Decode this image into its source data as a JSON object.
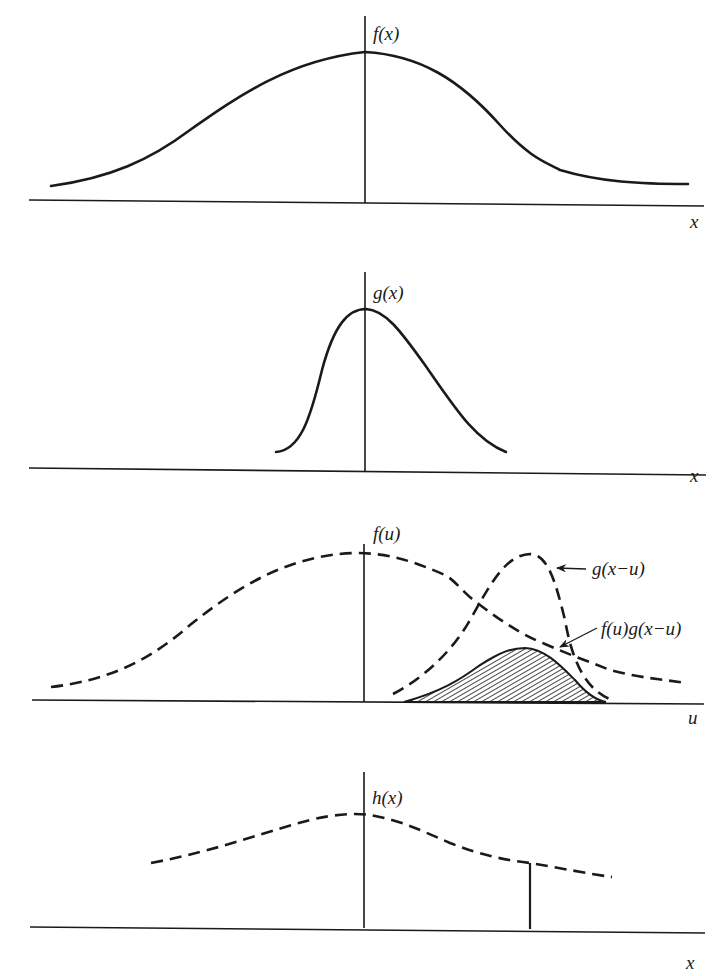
{
  "panels": [
    {
      "id": "f",
      "y_label": "f(x)",
      "x_label": "x",
      "curve": "f(x)",
      "style": "solid"
    },
    {
      "id": "g",
      "y_label": "g(x)",
      "x_label": "x",
      "curve": "g(x)",
      "style": "solid"
    },
    {
      "id": "conv",
      "y_label": "f(u)",
      "x_label": "u",
      "curves": [
        "f(u)",
        "g(x−u)",
        "f(u)g(x−u)"
      ],
      "annotations": [
        "g(x−u)",
        "f(u)g(x−u)"
      ],
      "shaded_region": "f(u)g(x−u)"
    },
    {
      "id": "h",
      "y_label": "h(x)",
      "x_label": "x",
      "curve": "h(x)",
      "style": "dashed",
      "marker": "vertical line at x"
    }
  ],
  "colors": {
    "ink": "#1a1a1a",
    "background": "#ffffff"
  }
}
